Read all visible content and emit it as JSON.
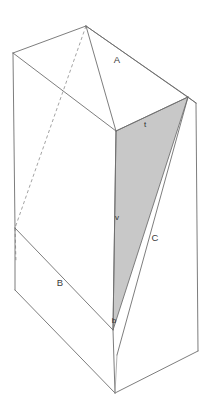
{
  "figure": {
    "background_color": "#ffffff",
    "line_color": "#6e6e6e",
    "shade_color": "#c8c8c8",
    "hidden_line_style": "dashed"
  },
  "labels": {
    "edge_a": "A",
    "edge_b": "B",
    "edge_c": "C",
    "point_t": "t",
    "point_v": "v",
    "point_b": "b"
  },
  "label_positions": {
    "edge_a": {
      "x": 117,
      "y": 60
    },
    "edge_b": {
      "x": 60,
      "y": 283
    },
    "edge_c": {
      "x": 155,
      "y": 238
    },
    "point_t": {
      "x": 145,
      "y": 125
    },
    "point_v": {
      "x": 117,
      "y": 218
    },
    "point_b": {
      "x": 114,
      "y": 321
    }
  },
  "geometry": {
    "vertices": {
      "top_apex": {
        "x": 86,
        "y": 26
      },
      "top_left": {
        "x": 13,
        "y": 53
      },
      "top_front": {
        "x": 116,
        "y": 131
      },
      "top_right": {
        "x": 188,
        "y": 97
      },
      "top_right_outer": {
        "x": 196,
        "y": 103
      },
      "mid_left": {
        "x": 15,
        "y": 228
      },
      "bottom_left": {
        "x": 15,
        "y": 290
      },
      "bottom_front": {
        "x": 115,
        "y": 393
      },
      "bottom_front_inner": {
        "x": 113,
        "y": 330
      },
      "bottom_right": {
        "x": 198,
        "y": 351
      },
      "shade_apex_low": {
        "x": 117,
        "y": 355
      }
    },
    "shaded_face": "t-v-b triangular section on right-hand face",
    "hidden_edge": "dashed diagonal from top_apex to mid_left"
  }
}
